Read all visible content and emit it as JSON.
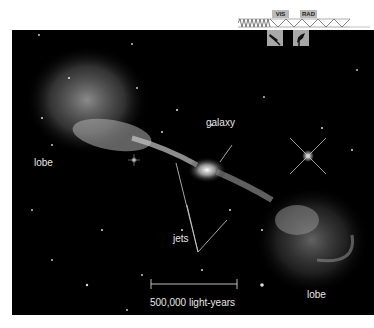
{
  "figure": {
    "labels": {
      "lobe_left": "lobe",
      "galaxy": "galaxy",
      "jets": "jets",
      "lobe_right": "lobe",
      "scale_bar": "500,000 light-years"
    },
    "wavelength_tags": {
      "visible": "VIS",
      "radio": "RAD"
    },
    "icons": [
      "optical-telescope-icon",
      "radio-dish-icon"
    ],
    "colors": {
      "background": "#000000",
      "page": "#ffffff",
      "label_text": "#e6e6e6",
      "tag_fill": "#b9b9b9"
    }
  }
}
